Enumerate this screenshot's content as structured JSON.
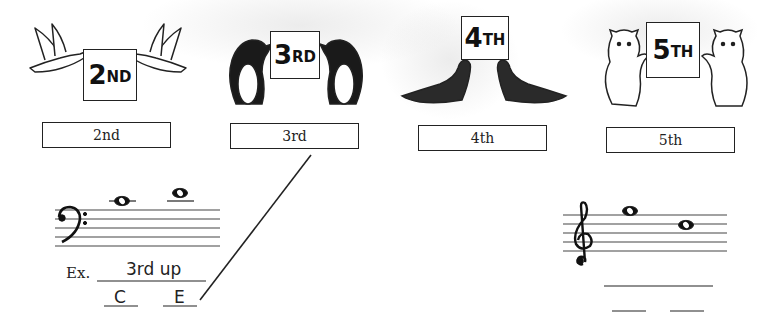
{
  "worksheet": {
    "animals": [
      {
        "id": "doves",
        "sign_num": "2",
        "sign_suffix": "ND",
        "label": "2nd"
      },
      {
        "id": "penguins",
        "sign_num": "3",
        "sign_suffix": "RD",
        "label": "3rd"
      },
      {
        "id": "seals",
        "sign_num": "4",
        "sign_suffix": "TH",
        "label": "4th"
      },
      {
        "id": "bears",
        "sign_num": "5",
        "sign_suffix": "TH",
        "label": "5th"
      }
    ],
    "example": {
      "prefix": "Ex.",
      "answer": "3rd up",
      "note1": "C",
      "note2": "E",
      "clef": "bass"
    },
    "exercise": {
      "clef": "treble",
      "answer": "",
      "note1": "",
      "note2": ""
    },
    "colors": {
      "ink": "#222222",
      "paper": "#ffffff"
    }
  }
}
